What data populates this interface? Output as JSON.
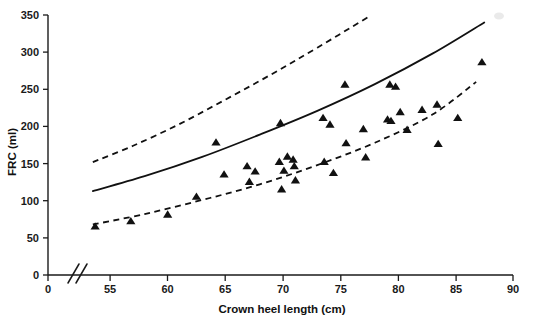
{
  "chart_data": {
    "type": "scatter",
    "title": "",
    "xlabel": "Crown heel length (cm)",
    "ylabel": "FRC (ml)",
    "xlim": [
      0,
      90
    ],
    "ylim": [
      0,
      350
    ],
    "grid": false,
    "legend": "none",
    "axis_break": {
      "axis": "x",
      "between": [
        0,
        53
      ],
      "symbol": "//"
    },
    "xticks": [
      0,
      55,
      60,
      65,
      70,
      75,
      80,
      85,
      90
    ],
    "xtick_labels": [
      "0",
      "55",
      "60",
      "65",
      "70",
      "75",
      "80",
      "85",
      "90"
    ],
    "yticks": [
      0,
      50,
      100,
      150,
      200,
      250,
      300,
      350
    ],
    "ytick_labels": [
      "0",
      "50",
      "100",
      "150",
      "200",
      "250",
      "300",
      "350"
    ],
    "marker_shape": "triangle-up",
    "marker_color": "#111111",
    "points": [
      {
        "x": 53.7,
        "y": 65
      },
      {
        "x": 56.8,
        "y": 72
      },
      {
        "x": 60.0,
        "y": 81
      },
      {
        "x": 62.5,
        "y": 105
      },
      {
        "x": 64.2,
        "y": 178
      },
      {
        "x": 64.9,
        "y": 135
      },
      {
        "x": 66.9,
        "y": 146
      },
      {
        "x": 67.1,
        "y": 125
      },
      {
        "x": 67.6,
        "y": 139
      },
      {
        "x": 69.7,
        "y": 152
      },
      {
        "x": 69.8,
        "y": 204
      },
      {
        "x": 69.9,
        "y": 115
      },
      {
        "x": 70.1,
        "y": 140
      },
      {
        "x": 70.4,
        "y": 159
      },
      {
        "x": 70.9,
        "y": 155
      },
      {
        "x": 71.0,
        "y": 146
      },
      {
        "x": 71.1,
        "y": 127
      },
      {
        "x": 73.5,
        "y": 211
      },
      {
        "x": 73.6,
        "y": 152
      },
      {
        "x": 74.1,
        "y": 202
      },
      {
        "x": 74.4,
        "y": 137
      },
      {
        "x": 75.4,
        "y": 256
      },
      {
        "x": 75.5,
        "y": 177
      },
      {
        "x": 77.0,
        "y": 196
      },
      {
        "x": 77.2,
        "y": 158
      },
      {
        "x": 79.1,
        "y": 209
      },
      {
        "x": 79.3,
        "y": 256
      },
      {
        "x": 79.4,
        "y": 207
      },
      {
        "x": 79.8,
        "y": 253
      },
      {
        "x": 80.2,
        "y": 219
      },
      {
        "x": 80.8,
        "y": 195
      },
      {
        "x": 82.1,
        "y": 222
      },
      {
        "x": 83.4,
        "y": 229
      },
      {
        "x": 83.5,
        "y": 176
      },
      {
        "x": 85.2,
        "y": 211
      },
      {
        "x": 87.3,
        "y": 286
      }
    ],
    "series": [
      {
        "name": "upper-limit-curve",
        "style": "dashed",
        "x": [
          53.5,
          57,
          61,
          65,
          69,
          73,
          77.5
        ],
        "y": [
          152,
          174,
          203,
          236,
          270,
          306,
          348
        ]
      },
      {
        "name": "fitted-mean-curve",
        "style": "solid",
        "x": [
          53.5,
          58,
          63,
          68,
          73,
          78,
          83,
          87.5
        ],
        "y": [
          113,
          133,
          159,
          189,
          221,
          257,
          298,
          340
        ]
      },
      {
        "name": "lower-limit-curve",
        "style": "dashed",
        "x": [
          53.5,
          58,
          63,
          68,
          73,
          78,
          83,
          86.8
        ],
        "y": [
          68,
          82,
          101,
          122,
          148,
          178,
          216,
          260
        ]
      }
    ]
  },
  "axis": {
    "x_title": "Crown heel length (cm)",
    "y_title": "FRC (ml)"
  }
}
